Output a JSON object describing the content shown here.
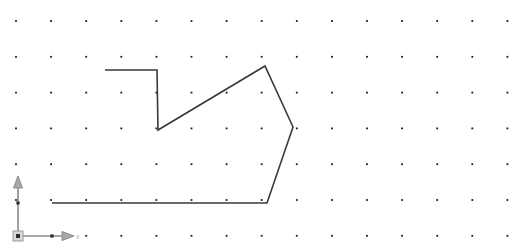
{
  "canvas": {
    "width": 518,
    "height": 251,
    "background_color": "#ffffff",
    "name_label": "sketch-canvas"
  },
  "grid": {
    "dot_color": "#1a1a1a",
    "dot_size": 1.8,
    "origin_x": 16,
    "origin_y": 21,
    "spacing_x": 35.1,
    "spacing_y": 35.8,
    "cols": 15,
    "rows": 7
  },
  "shape": {
    "name": "open-polyline-profile",
    "stroke_color": "#3a3a3a",
    "stroke_width": 1.6,
    "vertices": [
      [
        105,
        70
      ],
      [
        157,
        70
      ],
      [
        158,
        130
      ],
      [
        265,
        66
      ],
      [
        293,
        127
      ],
      [
        267,
        203
      ],
      [
        52,
        203
      ]
    ],
    "closed": false
  },
  "axes": {
    "origin": [
      18,
      236
    ],
    "x_axis": {
      "label": "x",
      "from": [
        18,
        236
      ],
      "to": [
        62,
        236
      ],
      "arrow_tip": [
        74,
        236
      ],
      "tick_at": [
        52,
        236
      ],
      "label_pos": [
        76,
        239
      ]
    },
    "y_axis": {
      "label": "",
      "from": [
        18,
        236
      ],
      "to": [
        18,
        188
      ],
      "arrow_tip": [
        18,
        176
      ],
      "tick_at": [
        18,
        203
      ]
    },
    "axis_color": "#8a8a8a",
    "arrow_fill": "#a8a8a8",
    "origin_marker_color": "#d9d9d9"
  }
}
